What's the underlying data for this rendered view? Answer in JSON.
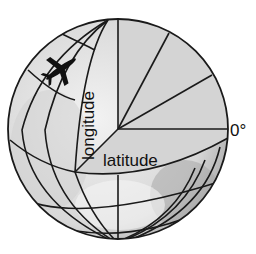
{
  "diagram": {
    "labels": {
      "longitude": "longitude",
      "latitude": "latitude",
      "zero_degree": "0°"
    },
    "icons": {
      "airplane": "airplane-icon"
    },
    "colors": {
      "line": "#1a1a1a",
      "wedge_fill": "#d4d4d4",
      "globe_fill": "#e8e8e8",
      "shadow": "#9a9a9a",
      "background": "#ffffff"
    }
  }
}
